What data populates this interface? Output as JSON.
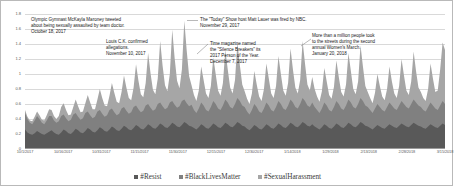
{
  "chart_data": {
    "type": "area",
    "stacked": true,
    "title": "",
    "subtitle": "",
    "xlabel": "",
    "ylabel": "",
    "ylim": [
      0,
      1.8
    ],
    "grid": true,
    "legend_position": "bottom",
    "y_ticks": [
      "0",
      "0.2",
      "0.4",
      "0.6",
      "0.8",
      "1",
      "1.2",
      "1.4",
      "1.6",
      "1.8"
    ],
    "y_tick_values": [
      0,
      0.2,
      0.4,
      0.6,
      0.8,
      1.0,
      1.2,
      1.4,
      1.6,
      1.8
    ],
    "x_ticks": [
      "10/1/2017",
      "10/16/2017",
      "10/31/2017",
      "11/15/2017",
      "11/30/2017",
      "12/15/2017",
      "12/30/2017",
      "1/14/2018",
      "1/29/2018",
      "2/13/2018",
      "2/28/2018",
      "3/15/2018"
    ],
    "x_range": [
      "10/1/2017",
      "3/22/2018"
    ],
    "series": [
      {
        "name": "#Resist",
        "color": "#595959",
        "values": [
          0.26,
          0.22,
          0.2,
          0.19,
          0.21,
          0.24,
          0.22,
          0.2,
          0.19,
          0.21,
          0.23,
          0.25,
          0.22,
          0.2,
          0.19,
          0.22,
          0.26,
          0.24,
          0.21,
          0.2,
          0.23,
          0.27,
          0.25,
          0.22,
          0.21,
          0.24,
          0.28,
          0.26,
          0.23,
          0.22,
          0.25,
          0.29,
          0.27,
          0.24,
          0.23,
          0.26,
          0.3,
          0.28,
          0.25,
          0.24,
          0.27,
          0.31,
          0.29,
          0.26,
          0.25,
          0.28,
          0.32,
          0.3,
          0.27,
          0.26,
          0.29,
          0.33,
          0.31,
          0.28,
          0.27,
          0.3,
          0.34,
          0.32,
          0.29,
          0.28,
          0.31,
          0.35,
          0.33,
          0.3,
          0.29,
          0.32,
          0.36,
          0.34,
          0.31,
          0.3,
          0.28,
          0.26,
          0.29,
          0.33,
          0.31,
          0.28,
          0.27,
          0.3,
          0.34,
          0.32,
          0.29,
          0.28,
          0.31,
          0.35,
          0.33,
          0.3,
          0.29,
          0.32,
          0.36,
          0.34,
          0.31,
          0.3,
          0.27,
          0.25,
          0.28,
          0.32,
          0.3,
          0.27,
          0.26,
          0.29,
          0.33,
          0.31,
          0.28,
          0.27,
          0.3,
          0.34,
          0.32,
          0.29,
          0.28,
          0.31,
          0.35,
          0.33,
          0.3,
          0.29,
          0.32,
          0.36,
          0.34,
          0.31,
          0.3,
          0.33,
          0.3,
          0.28,
          0.26,
          0.29,
          0.33,
          0.31,
          0.28,
          0.27,
          0.3,
          0.34,
          0.32,
          0.29,
          0.28,
          0.31,
          0.35,
          0.33,
          0.3,
          0.29,
          0.32,
          0.36,
          0.34,
          0.31,
          0.3,
          0.28,
          0.26,
          0.29,
          0.32,
          0.3,
          0.28,
          0.27,
          0.3,
          0.33,
          0.31,
          0.29,
          0.28,
          0.31,
          0.34,
          0.32,
          0.3,
          0.29,
          0.32,
          0.35,
          0.33,
          0.31,
          0.3,
          0.28,
          0.27,
          0.3,
          0.33,
          0.31,
          0.29,
          0.28,
          0.31,
          0.34,
          0.32
        ]
      },
      {
        "name": "#BlackLivesMatter",
        "color": "#808080",
        "values": [
          0.22,
          0.18,
          0.15,
          0.14,
          0.17,
          0.2,
          0.18,
          0.15,
          0.14,
          0.17,
          0.21,
          0.19,
          0.16,
          0.15,
          0.18,
          0.22,
          0.2,
          0.17,
          0.16,
          0.19,
          0.23,
          0.21,
          0.18,
          0.17,
          0.2,
          0.24,
          0.22,
          0.19,
          0.18,
          0.21,
          0.25,
          0.23,
          0.2,
          0.19,
          0.22,
          0.26,
          0.24,
          0.21,
          0.2,
          0.23,
          0.27,
          0.25,
          0.22,
          0.21,
          0.24,
          0.28,
          0.26,
          0.23,
          0.22,
          0.25,
          0.29,
          0.27,
          0.24,
          0.23,
          0.26,
          0.3,
          0.28,
          0.25,
          0.24,
          0.27,
          0.31,
          0.29,
          0.26,
          0.25,
          0.28,
          0.32,
          0.3,
          0.27,
          0.26,
          0.29,
          0.24,
          0.22,
          0.25,
          0.29,
          0.27,
          0.24,
          0.23,
          0.26,
          0.3,
          0.28,
          0.25,
          0.24,
          0.27,
          0.31,
          0.29,
          0.26,
          0.25,
          0.28,
          0.32,
          0.3,
          0.27,
          0.26,
          0.23,
          0.21,
          0.24,
          0.28,
          0.26,
          0.23,
          0.22,
          0.25,
          0.29,
          0.27,
          0.24,
          0.23,
          0.26,
          0.3,
          0.28,
          0.25,
          0.24,
          0.27,
          0.31,
          0.29,
          0.26,
          0.25,
          0.28,
          0.32,
          0.3,
          0.27,
          0.26,
          0.29,
          0.26,
          0.24,
          0.22,
          0.25,
          0.29,
          0.27,
          0.24,
          0.23,
          0.26,
          0.3,
          0.28,
          0.25,
          0.24,
          0.27,
          0.31,
          0.29,
          0.26,
          0.25,
          0.28,
          0.32,
          0.3,
          0.27,
          0.26,
          0.24,
          0.22,
          0.25,
          0.28,
          0.26,
          0.24,
          0.23,
          0.26,
          0.29,
          0.27,
          0.25,
          0.24,
          0.27,
          0.3,
          0.28,
          0.26,
          0.25,
          0.28,
          0.31,
          0.29,
          0.27,
          0.26,
          0.24,
          0.23,
          0.26,
          0.29,
          0.27,
          0.25,
          0.24,
          0.27,
          0.3,
          0.28
        ]
      },
      {
        "name": "#SexualHarassment",
        "color": "#a6a6a6",
        "values": [
          0.04,
          0.03,
          0.03,
          0.04,
          0.05,
          0.06,
          0.05,
          0.04,
          0.05,
          0.07,
          0.09,
          0.08,
          0.06,
          0.05,
          0.07,
          0.12,
          0.15,
          0.11,
          0.08,
          0.07,
          0.1,
          0.18,
          0.14,
          0.1,
          0.09,
          0.13,
          0.22,
          0.17,
          0.12,
          0.1,
          0.16,
          0.28,
          0.21,
          0.15,
          0.12,
          0.19,
          0.34,
          0.26,
          0.18,
          0.14,
          0.22,
          0.42,
          0.31,
          0.21,
          0.16,
          0.26,
          0.55,
          0.38,
          0.24,
          0.18,
          0.3,
          0.68,
          0.46,
          0.28,
          0.2,
          0.34,
          0.82,
          0.54,
          0.32,
          0.22,
          0.38,
          0.95,
          0.62,
          0.36,
          0.24,
          0.42,
          1.05,
          0.7,
          0.4,
          0.26,
          0.2,
          0.16,
          0.24,
          0.48,
          0.34,
          0.22,
          0.18,
          0.28,
          0.58,
          0.4,
          0.24,
          0.19,
          0.3,
          0.66,
          0.44,
          0.26,
          0.2,
          0.32,
          0.74,
          0.48,
          0.28,
          0.21,
          0.17,
          0.14,
          0.22,
          0.44,
          0.3,
          0.2,
          0.16,
          0.26,
          0.52,
          0.36,
          0.22,
          0.18,
          0.28,
          0.6,
          0.4,
          0.24,
          0.19,
          0.3,
          0.68,
          0.44,
          0.26,
          0.2,
          0.32,
          0.76,
          0.5,
          0.28,
          0.22,
          0.34,
          0.24,
          0.18,
          0.15,
          0.23,
          0.46,
          0.32,
          0.2,
          0.17,
          0.27,
          0.54,
          0.36,
          0.22,
          0.18,
          0.28,
          0.62,
          0.42,
          0.24,
          0.19,
          0.3,
          0.7,
          0.46,
          0.26,
          0.2,
          0.16,
          0.13,
          0.21,
          0.4,
          0.28,
          0.18,
          0.15,
          0.24,
          0.48,
          0.32,
          0.2,
          0.16,
          0.26,
          0.56,
          0.38,
          0.22,
          0.18,
          0.3,
          0.64,
          0.42,
          0.24,
          0.2,
          0.16,
          0.14,
          0.24,
          0.52,
          0.36,
          0.22,
          0.26,
          0.48,
          0.78,
          0.72
        ]
      }
    ],
    "annotations": [
      {
        "id": "maroney",
        "text": "Olympic Gymnast McKayla Maroney tweeted\nabout being sexually assaulted by team doctor.\nOctober 18, 2017",
        "date": "October 18, 2017"
      },
      {
        "id": "louisck",
        "text": "Louis C.K. confirmed\nallegations.\nNovember 10, 2017",
        "date": "November 10, 2017"
      },
      {
        "id": "lauer",
        "text": "The \"Today\" Show host Matt Lauer was fired by NBC.\nNovember 29, 2017",
        "date": "November 29, 2017"
      },
      {
        "id": "time",
        "text": "Time magazine named\nthe \"Silence Breakers\" its\n2017 Person of the Year.\nDecember 7, 2017",
        "date": "December 7, 2017"
      },
      {
        "id": "womensmarch",
        "text": "More than a million people took\nto the streets during the second\nannual Women's March.\nJanuary 20, 2018",
        "date": "January 20, 2018"
      }
    ]
  }
}
